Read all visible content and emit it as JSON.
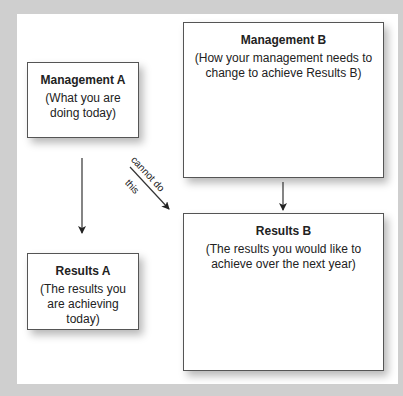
{
  "diagram": {
    "boxes": {
      "management_a": {
        "title": "Management A",
        "desc_line1": "(What you are",
        "desc_line2": "doing today)"
      },
      "results_a": {
        "title": "Results A",
        "desc_line1": "(The results you",
        "desc_line2": "are achieving",
        "desc_line3": "today)"
      },
      "management_b": {
        "title": "Management B",
        "desc_line1": "(How your management needs to",
        "desc_line2": "change to achieve Results B)"
      },
      "results_b": {
        "title": "Results B",
        "desc_line1": "(The results you would like to",
        "desc_line2": "achieve over the next year)"
      }
    },
    "arrows": [
      {
        "from": "Management A",
        "to": "Results A",
        "label": ""
      },
      {
        "from": "Management B",
        "to": "Results B",
        "label": ""
      },
      {
        "from": "Management A",
        "to": "Results B",
        "label_above": "cannot do",
        "label_below": "this"
      }
    ],
    "colors": {
      "background": "#cfcfcf",
      "panel": "#ffffff",
      "border": "#555555",
      "text": "#222222"
    }
  }
}
